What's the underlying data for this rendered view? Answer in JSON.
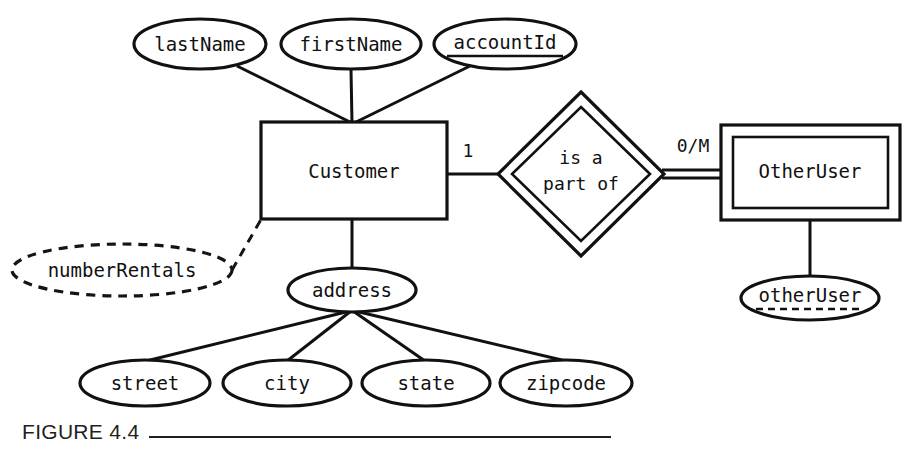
{
  "figure": {
    "caption_label": "FIGURE 4.4",
    "caption_rule": true
  },
  "diagram": {
    "kind": "entity-relationship-diagram",
    "notation": "Chen",
    "entities": [
      {
        "id": "customer",
        "label": "Customer",
        "type": "strong-entity",
        "border": "single"
      },
      {
        "id": "otherUser",
        "label": "OtherUser",
        "type": "weak-entity",
        "border": "double"
      }
    ],
    "relationships": [
      {
        "id": "is-a-part-of",
        "label_line1": "is a",
        "label_line2": "part of",
        "type": "identifying-relationship",
        "border": "double",
        "left_cardinality": "1",
        "right_cardinality": "0/M",
        "left_entity": "Customer",
        "right_entity": "OtherUser"
      }
    ],
    "attributes": [
      {
        "id": "lastName",
        "label": "lastName",
        "owner": "Customer",
        "style": "solid",
        "key": "none"
      },
      {
        "id": "firstName",
        "label": "firstName",
        "owner": "Customer",
        "style": "solid",
        "key": "none"
      },
      {
        "id": "accountId",
        "label": "accountId",
        "owner": "Customer",
        "style": "solid",
        "key": "primary"
      },
      {
        "id": "numberRentals",
        "label": "numberRentals",
        "owner": "Customer",
        "style": "dashed",
        "key": "none"
      },
      {
        "id": "address",
        "label": "address",
        "owner": "Customer",
        "style": "solid",
        "key": "none"
      },
      {
        "id": "street",
        "label": "street",
        "owner": "address",
        "style": "solid",
        "key": "none"
      },
      {
        "id": "city",
        "label": "city",
        "owner": "address",
        "style": "solid",
        "key": "none"
      },
      {
        "id": "state",
        "label": "state",
        "owner": "address",
        "style": "solid",
        "key": "none"
      },
      {
        "id": "zipcode",
        "label": "zipcode",
        "owner": "address",
        "style": "solid",
        "key": "none"
      },
      {
        "id": "otherUserAttr",
        "label": "otherUser",
        "owner": "OtherUser",
        "style": "solid",
        "key": "partial"
      }
    ],
    "colors": {
      "stroke": "#111111",
      "fill": "#ffffff",
      "background": "#ffffff",
      "caption": "#231f20"
    }
  }
}
